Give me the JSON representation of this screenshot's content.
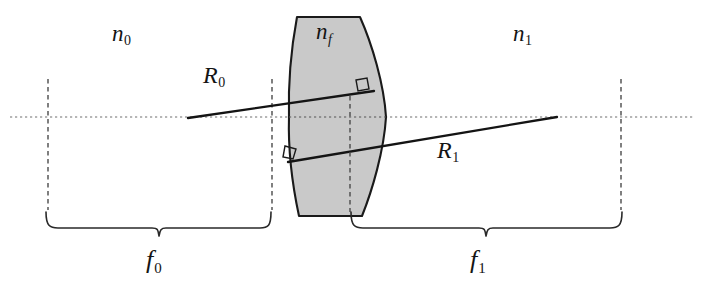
{
  "figure": {
    "kind": "optical-ray-diagram",
    "canvas": {
      "width": 702,
      "height": 298
    },
    "colors": {
      "background": "#ffffff",
      "lens_fill": "#c9c9c9",
      "lens_stroke": "#1a1a1a",
      "ray_stroke": "#141414",
      "axis_dotted": "#6e6e6e",
      "dashed_guide": "#4a4a4a",
      "brace_stroke": "#2a2a2a",
      "label_color": "#141414"
    },
    "optical_axis": {
      "y": 117,
      "x_start": 10,
      "x_end": 694,
      "style": "dotted"
    }
  },
  "labels": {
    "n0": {
      "base": "n",
      "sub": "0",
      "description": "refractive index of object space"
    },
    "nf": {
      "base": "n",
      "sub": "f",
      "description": "refractive index of lens material"
    },
    "n1": {
      "base": "n",
      "sub": "1",
      "description": "refractive index of image space"
    },
    "R0": {
      "base": "R",
      "sub": "0",
      "description": "incident ray in object space"
    },
    "R1": {
      "base": "R",
      "sub": "1",
      "description": "refracted ray in image space"
    },
    "f0": {
      "base": "f",
      "sub": "0",
      "description": "front focal length"
    },
    "f1": {
      "base": "f",
      "sub": "1",
      "description": "back focal length"
    }
  },
  "lens": {
    "name": "thick-biconvex-lens",
    "top_y": 17,
    "bottom_y": 216,
    "top_left_x": 297,
    "top_right_x": 360,
    "bottom_left_x": 299,
    "bottom_right_x": 362,
    "left_vertex_x": 289,
    "right_vertex_x": 386,
    "fill": "#c9c9c9"
  },
  "rays": {
    "R0": {
      "name": "incident-ray",
      "from": {
        "x": 188,
        "y": 118
      },
      "to": {
        "x": 374,
        "y": 91
      },
      "note": "starts on axis in object space, strikes lens front surface"
    },
    "R1": {
      "name": "refracted-ray",
      "from": {
        "x": 288,
        "y": 162
      },
      "to": {
        "x": 557,
        "y": 117
      },
      "note": "exits lens, crosses axis at back focal point"
    }
  },
  "right_angle_markers": [
    {
      "name": "normal-marker-upper-right",
      "x": 362,
      "y": 84
    },
    {
      "name": "normal-marker-lower-left",
      "x": 289,
      "y": 152
    }
  ],
  "guides": {
    "vertical_dashed": [
      {
        "name": "front-focal-plane-guide",
        "x": 48,
        "y_top": 79,
        "y_bottom": 210
      },
      {
        "name": "front-principal-plane-guide",
        "x": 272,
        "y_top": 79,
        "y_bottom": 210
      },
      {
        "name": "lens-center-guide",
        "x": 350,
        "y_top": 96,
        "y_bottom": 212
      },
      {
        "name": "back-focal-plane-guide",
        "x": 621,
        "y_top": 79,
        "y_bottom": 210
      }
    ]
  },
  "braces": [
    {
      "name": "brace-f0",
      "x_left": 46,
      "x_right": 271,
      "y": 228,
      "label": "f0"
    },
    {
      "name": "brace-f1",
      "x_left": 351,
      "x_right": 622,
      "y": 228,
      "label": "f1"
    }
  ]
}
